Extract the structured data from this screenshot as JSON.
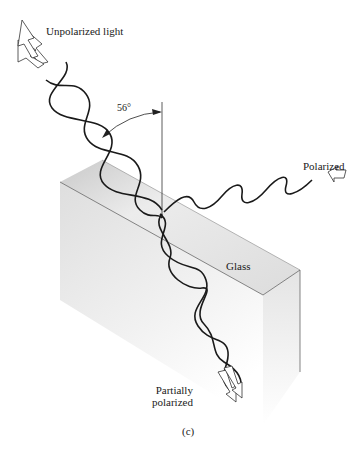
{
  "figure": {
    "labels": {
      "unpolarized": "Unpolarized light",
      "angle": "56°",
      "polarized": "Polarized",
      "glass": "Glass",
      "partially_line1": "Partially",
      "partially_line2": "polarized",
      "caption": "(c)"
    },
    "angle_degrees": 56,
    "colors": {
      "ink": "#1a1a1a",
      "glass_light": "#efefef",
      "glass_dark": "#cfcfcf",
      "edge": "#555555"
    }
  }
}
